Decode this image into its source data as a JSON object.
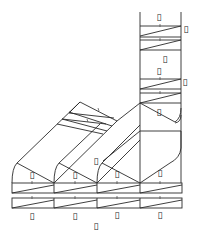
{
  "diagram": {
    "type": "technical-line-drawing",
    "stroke_color": "#2a2a2a",
    "background": "#ffffff",
    "labels": [
      {
        "id": "tower-top",
        "text": "▯",
        "x": 159,
        "y": 17
      },
      {
        "id": "tower-right-1",
        "text": "▯",
        "x": 186,
        "y": 29
      },
      {
        "id": "tower-mid-right",
        "text": "▯",
        "x": 165,
        "y": 59
      },
      {
        "id": "tower-mid",
        "text": "▯",
        "x": 159,
        "y": 71
      },
      {
        "id": "tower-right-2",
        "text": "▯",
        "x": 185,
        "y": 82
      },
      {
        "id": "tower-lower",
        "text": "▯",
        "x": 159,
        "y": 112
      },
      {
        "id": "mid-column",
        "text": "▯",
        "x": 96,
        "y": 161
      },
      {
        "id": "col1-upper",
        "text": "▯",
        "x": 32,
        "y": 175
      },
      {
        "id": "col2-upper",
        "text": "▯",
        "x": 75,
        "y": 175
      },
      {
        "id": "col3-upper",
        "text": "▯",
        "x": 117,
        "y": 174
      },
      {
        "id": "col4-upper",
        "text": "▯",
        "x": 160,
        "y": 173
      },
      {
        "id": "col1-bottom",
        "text": "▯",
        "x": 32,
        "y": 216
      },
      {
        "id": "col2-bottom",
        "text": "▯",
        "x": 75,
        "y": 216
      },
      {
        "id": "col3-bottom",
        "text": "▯",
        "x": 117,
        "y": 215
      },
      {
        "id": "col4-bottom",
        "text": "▯",
        "x": 160,
        "y": 215
      },
      {
        "id": "center-bottom",
        "text": "▯",
        "x": 96,
        "y": 226
      }
    ]
  }
}
